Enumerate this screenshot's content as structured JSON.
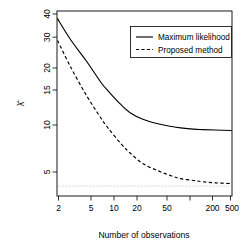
{
  "chart_data": {
    "type": "line",
    "title": "",
    "xlabel": "Number of observations",
    "ylabel": "λ̂",
    "xscale": "log",
    "yscale": "log",
    "xlim": [
      2,
      500
    ],
    "ylim": [
      3.2,
      42
    ],
    "grid": false,
    "legend_position": "top-right",
    "xticks": [
      2,
      5,
      10,
      20,
      50,
      200,
      500
    ],
    "xticklabels": [
      "2",
      "5",
      "10",
      "20",
      "50",
      "200",
      "500"
    ],
    "yticks": [
      5,
      10,
      15,
      20,
      30,
      40
    ],
    "yticklabels": [
      "5",
      "10",
      "15",
      "20",
      "30",
      "40"
    ],
    "x": [
      2,
      3,
      5,
      8,
      10,
      15,
      20,
      30,
      50,
      75,
      100,
      150,
      200,
      300,
      500
    ],
    "series": [
      {
        "name": "Maximum likelihood",
        "style": "solid",
        "values": [
          38.0,
          28.5,
          21.0,
          15.5,
          13.8,
          11.4,
          10.2,
          9.3,
          8.7,
          8.4,
          8.25,
          8.1,
          8.05,
          8.0,
          7.95
        ]
      },
      {
        "name": "Proposed method",
        "style": "dashed",
        "values": [
          28.0,
          19.5,
          13.0,
          9.4,
          8.2,
          6.6,
          5.8,
          5.0,
          4.5,
          4.2,
          4.05,
          3.95,
          3.88,
          3.82,
          3.78
        ]
      }
    ],
    "reference_line": {
      "name": "true-value",
      "style": "dotted",
      "value": 3.65,
      "color": "#b9b9b9"
    },
    "legend_entries": [
      "Maximum likelihood",
      "Proposed method"
    ]
  }
}
